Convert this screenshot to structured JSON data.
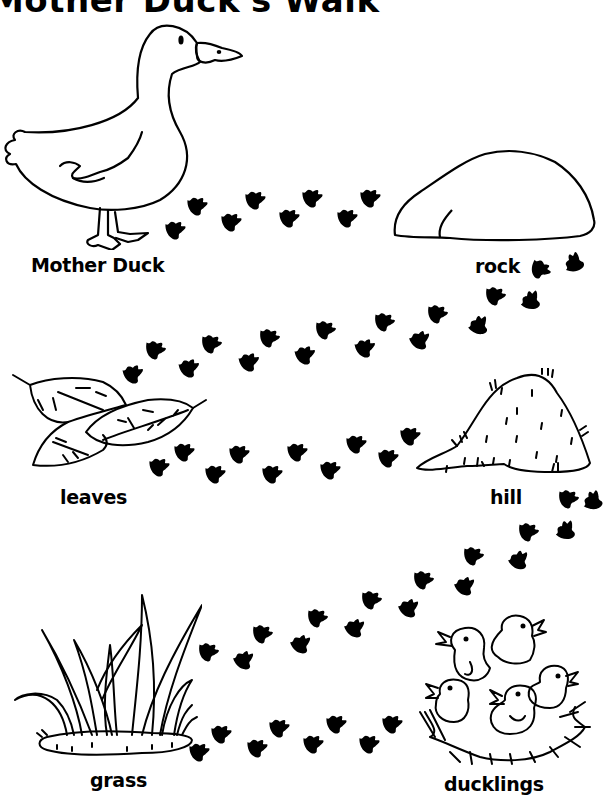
{
  "worksheet": {
    "title": "Mother Duck's Walk",
    "ink_color": "#000000",
    "background_color": "#ffffff",
    "stops": [
      {
        "id": "mother-duck",
        "label": "Mother Duck",
        "icon": "duck-icon"
      },
      {
        "id": "rock",
        "label": "rock",
        "icon": "rock-icon"
      },
      {
        "id": "leaves",
        "label": "leaves",
        "icon": "leaves-icon"
      },
      {
        "id": "hill",
        "label": "hill",
        "icon": "hill-icon"
      },
      {
        "id": "grass",
        "label": "grass",
        "icon": "grass-icon"
      },
      {
        "id": "ducklings",
        "label": "ducklings",
        "icon": "ducklings-nest-icon"
      }
    ],
    "footprint_paths": [
      {
        "from": "mother-duck",
        "to": "rock",
        "icon": "duck-footprint-icon",
        "prints": [
          [
            176,
            230,
            -20
          ],
          [
            198,
            206,
            -20
          ],
          [
            232,
            222,
            -20
          ],
          [
            256,
            200,
            -20
          ],
          [
            290,
            218,
            -20
          ],
          [
            313,
            198,
            -20
          ],
          [
            348,
            218,
            -20
          ],
          [
            371,
            198,
            -20
          ]
        ]
      },
      {
        "from": "rock",
        "to": "leaves",
        "icon": "duck-footprint-icon",
        "prints": [
          [
            575,
            262,
            -90
          ],
          [
            541,
            270,
            10
          ],
          [
            532,
            300,
            -70
          ],
          [
            496,
            296,
            -10
          ],
          [
            480,
            325,
            -60
          ],
          [
            438,
            314,
            -10
          ],
          [
            421,
            340,
            -40
          ],
          [
            385,
            322,
            -10
          ],
          [
            366,
            348,
            -30
          ],
          [
            326,
            330,
            -10
          ],
          [
            306,
            355,
            -30
          ],
          [
            270,
            338,
            -10
          ],
          [
            250,
            362,
            -30
          ],
          [
            212,
            344,
            -10
          ],
          [
            190,
            368,
            -30
          ],
          [
            156,
            350,
            -10
          ],
          [
            134,
            374,
            -30
          ]
        ]
      },
      {
        "from": "leaves",
        "to": "hill",
        "icon": "duck-footprint-icon",
        "prints": [
          [
            160,
            467,
            -20
          ],
          [
            185,
            452,
            -20
          ],
          [
            216,
            474,
            -20
          ],
          [
            240,
            454,
            -20
          ],
          [
            273,
            474,
            -20
          ],
          [
            298,
            452,
            -20
          ],
          [
            331,
            470,
            -20
          ],
          [
            357,
            444,
            -20
          ],
          [
            389,
            458,
            -20
          ],
          [
            411,
            436,
            -20
          ]
        ]
      },
      {
        "from": "hill",
        "to": "grass",
        "icon": "duck-footprint-icon",
        "prints": [
          [
            594,
            500,
            -80
          ],
          [
            569,
            499,
            -10
          ],
          [
            567,
            530,
            -70
          ],
          [
            529,
            532,
            -10
          ],
          [
            520,
            560,
            -50
          ],
          [
            474,
            556,
            -10
          ],
          [
            466,
            586,
            -40
          ],
          [
            424,
            580,
            -10
          ],
          [
            410,
            608,
            -40
          ],
          [
            372,
            600,
            -10
          ],
          [
            356,
            628,
            -40
          ],
          [
            318,
            618,
            -10
          ],
          [
            302,
            644,
            -40
          ],
          [
            263,
            634,
            -10
          ],
          [
            245,
            660,
            -40
          ],
          [
            209,
            652,
            -10
          ]
        ]
      },
      {
        "from": "grass",
        "to": "ducklings",
        "icon": "duck-footprint-icon",
        "prints": [
          [
            200,
            752,
            -20
          ],
          [
            222,
            734,
            -20
          ],
          [
            258,
            748,
            -20
          ],
          [
            280,
            728,
            -20
          ],
          [
            314,
            744,
            -20
          ],
          [
            337,
            724,
            -20
          ],
          [
            370,
            744,
            -20
          ],
          [
            393,
            724,
            -20
          ]
        ]
      }
    ]
  }
}
